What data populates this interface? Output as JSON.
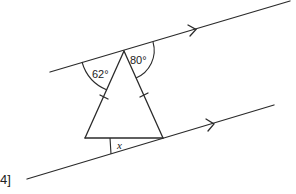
{
  "diagram": {
    "type": "geometry-parallel-lines-isosceles-triangle",
    "angles": {
      "left_top_angle": "62°",
      "right_top_angle": "80°",
      "unknown_angle": "x"
    },
    "marks_label": "4]",
    "elements": {
      "parallel_lines": 2,
      "arrow_marks": 2,
      "equal_side_ticks": 2
    }
  }
}
